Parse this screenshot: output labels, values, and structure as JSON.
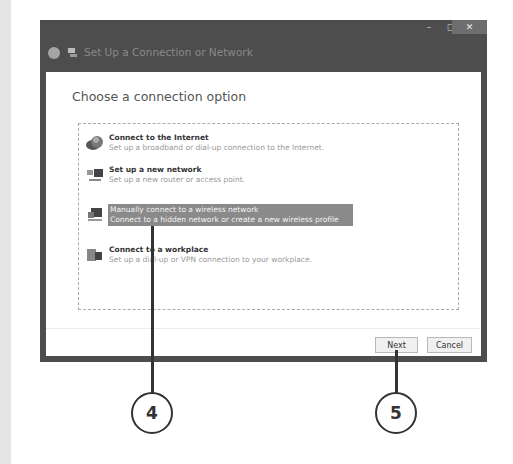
{
  "window": {
    "title": "Set Up a Connection or Network",
    "controls": {
      "minimize": "–",
      "maximize": "□",
      "close": "✕"
    }
  },
  "dialog": {
    "heading": "Choose a connection option",
    "options": [
      {
        "title": "Connect to the Internet",
        "description": "Set up a broadband or dial-up connection to the Internet.",
        "icon": "globe-network-icon",
        "selected": false
      },
      {
        "title": "Set up a new network",
        "description": "Set up a new router or access point.",
        "icon": "router-network-icon",
        "selected": false
      },
      {
        "title": "Manually connect to a wireless network",
        "description": "Connect to a hidden network or create a new wireless profile",
        "icon": "wireless-computer-icon",
        "selected": true
      },
      {
        "title": "Connect to a workplace",
        "description": "Set up a dial-up or VPN connection to your workplace.",
        "icon": "workplace-phone-icon",
        "selected": false
      }
    ],
    "buttons": {
      "next": "Next",
      "cancel": "Cancel"
    }
  },
  "callouts": [
    {
      "number": "4",
      "target": "Manually connect to a wireless network"
    },
    {
      "number": "5",
      "target": "Next"
    }
  ],
  "colors": {
    "frame": "#4d4d4d",
    "selection": "#8a8a8a",
    "callout": "#333333"
  }
}
